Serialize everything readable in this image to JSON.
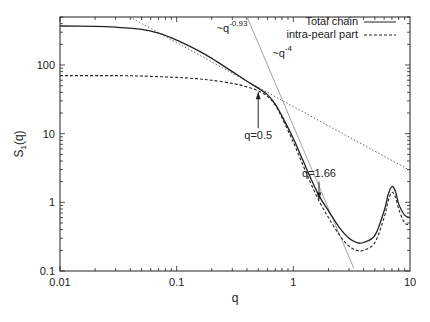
{
  "chart_data": {
    "type": "line",
    "title": "",
    "xlabel": "q",
    "ylabel": "S1(q)",
    "ylabel_main": "S",
    "ylabel_sub": "1",
    "ylabel_tail": "(q)",
    "xscale": "log",
    "yscale": "log",
    "xlim": [
      0.01,
      10
    ],
    "ylim": [
      0.1,
      500
    ],
    "grid": false,
    "legend_position": "top-right",
    "x_tick_labels": [
      "0.01",
      "0.1",
      "1",
      "10"
    ],
    "x_ticks": [
      0.01,
      0.1,
      1,
      10
    ],
    "y_tick_labels": [
      "0.1",
      "1",
      "10",
      "100"
    ],
    "y_ticks": [
      0.1,
      1,
      10,
      100
    ],
    "series": [
      {
        "name": "Total chain",
        "style": "solid",
        "color": "#222222",
        "x": [
          0.01,
          0.02,
          0.03,
          0.05,
          0.07,
          0.1,
          0.15,
          0.2,
          0.3,
          0.4,
          0.5,
          0.6,
          0.7,
          0.8,
          1.0,
          1.2,
          1.4,
          1.66,
          2.0,
          2.5,
          3.0,
          3.5,
          4.0,
          5.0,
          6.0,
          6.5,
          7.0,
          7.5,
          8.0,
          9.0,
          10.0
        ],
        "y": [
          370,
          365,
          355,
          330,
          290,
          230,
          165,
          125,
          80,
          58,
          46,
          37,
          27,
          18,
          8.5,
          4.2,
          2.3,
          1.25,
          0.75,
          0.42,
          0.3,
          0.26,
          0.26,
          0.33,
          0.75,
          1.3,
          1.7,
          1.45,
          0.95,
          0.65,
          0.6
        ]
      },
      {
        "name": "intra-pearl part",
        "style": "dashed",
        "color": "#222222",
        "x": [
          0.01,
          0.03,
          0.05,
          0.1,
          0.15,
          0.2,
          0.3,
          0.4,
          0.5,
          0.6,
          0.7,
          0.8,
          1.0,
          1.2,
          1.4,
          1.66,
          2.0,
          2.5,
          3.0,
          3.5,
          4.0,
          5.0,
          6.0,
          6.5,
          7.0,
          7.5,
          8.0,
          9.0,
          10.0
        ],
        "y": [
          70,
          70,
          69,
          66,
          63,
          60,
          54,
          48,
          42,
          35,
          26,
          17,
          7.5,
          3.6,
          1.95,
          1.05,
          0.6,
          0.33,
          0.23,
          0.2,
          0.2,
          0.26,
          0.6,
          1.05,
          1.4,
          1.2,
          0.8,
          0.5,
          0.48
        ]
      }
    ],
    "reference_lines": [
      {
        "name": "power law ~q^-0.93",
        "style": "dotted",
        "color": "#555555",
        "slope": -0.93,
        "anchor_x": 0.5,
        "anchor_y": 47.3,
        "x_range": [
          0.035,
          10
        ]
      },
      {
        "name": "power law ~q^-4",
        "style": "thin-solid",
        "color": "#999999",
        "slope": -4,
        "anchor_x": 1,
        "anchor_y": 13,
        "x_range": [
          0.32,
          3.3
        ]
      }
    ],
    "annotations": [
      {
        "text_main": "~q",
        "text_sup": "-0.93",
        "x": 0.22,
        "y": 300
      },
      {
        "text_main": "~q",
        "text_sup": "-4",
        "x": 0.66,
        "y": 130
      },
      {
        "text": "q=0.5",
        "x": 0.5,
        "y": 8.5,
        "arrow": "up",
        "arrow_from_y": 12,
        "arrow_to_y": 40
      },
      {
        "text": "q=1.66",
        "x": 1.66,
        "y": 2.3,
        "arrow": "down",
        "arrow_from_y": 2.0,
        "arrow_to_y": 1.1
      }
    ]
  },
  "legend": {
    "items": [
      {
        "label": "Total chain",
        "style": "solid"
      },
      {
        "label": "intra-pearl part",
        "style": "dashed"
      }
    ]
  }
}
